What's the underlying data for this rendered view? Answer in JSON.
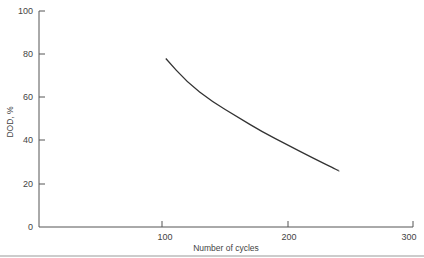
{
  "chart_data": {
    "type": "line",
    "title": "",
    "xlabel": "Number of cycles",
    "ylabel": "DOD, %",
    "xlim": [
      0,
      300
    ],
    "ylim": [
      0,
      100
    ],
    "x_ticks": [
      100,
      200,
      300
    ],
    "y_ticks": [
      0,
      20,
      40,
      60,
      80,
      100
    ],
    "grid": false,
    "legend": null,
    "series": [
      {
        "name": "DOD vs cycles",
        "x": [
          103,
          120,
          140,
          160,
          180,
          200,
          220,
          241
        ],
        "y": [
          78,
          67,
          58,
          51,
          44,
          38,
          32,
          26
        ]
      }
    ]
  },
  "labels": {
    "x_axis": "Number of cycles",
    "y_axis": "DOD, %",
    "y_tick_0": "0",
    "y_tick_20": "20",
    "y_tick_40": "40",
    "y_tick_60": "60",
    "y_tick_80": "80",
    "y_tick_100": "100",
    "x_tick_100": "100",
    "x_tick_200": "200",
    "x_tick_300": "300"
  },
  "colors": {
    "axis": "#555555",
    "curve": "#333333",
    "rule": "#999999"
  }
}
